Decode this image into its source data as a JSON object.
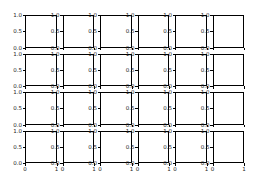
{
  "chart_data": {
    "type": "line",
    "title": "",
    "layout": {
      "rows": 4,
      "cols": 6,
      "sharex": false,
      "sharey": false
    },
    "subplots_empty": true,
    "xlabel": "",
    "ylabel": "",
    "xlim": [
      0,
      1
    ],
    "ylim": [
      0,
      1
    ],
    "x_tick_labels": [
      "0",
      "1"
    ],
    "y_tick_labels": [
      "0.0",
      "0.5",
      "1.0"
    ],
    "grid": false,
    "legend": null,
    "series": []
  },
  "figure": {
    "width": 253,
    "height": 177,
    "axes_left": [
      25,
      62.5,
      100,
      137.5,
      175,
      212.5
    ],
    "axes_width": 31.5,
    "axes_top": [
      15,
      53.5,
      92,
      130.5
    ],
    "axes_height": 32.5,
    "axis_color": "#000000",
    "text_color": "#222222",
    "background": "#ffffff"
  }
}
